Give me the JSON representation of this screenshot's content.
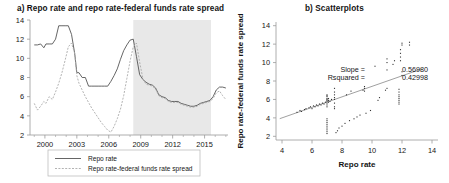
{
  "figure": {
    "panel_a_title": "a) Repo rate and repo rate-federal funds rate spread",
    "panel_b_title": "b) Scatterplots"
  },
  "colors": {
    "series_repo": "#555555",
    "series_spread": "#aaaaaa",
    "shaded_band": "#e8e8e8",
    "axis": "#9a9a9a",
    "point": "#333333",
    "fit_line": "#888888",
    "text": "#161616"
  },
  "panel_a": {
    "legend": [
      {
        "label": "Repo rate",
        "style": "solid"
      },
      {
        "label": "Repo rate-federal funds rate spread",
        "style": "dashed"
      }
    ],
    "yaxis": {
      "ticks": [
        2,
        4,
        6,
        8,
        10,
        12,
        14
      ],
      "tick_labels": [
        "2",
        "4",
        "6",
        "8",
        "10",
        "12",
        "14"
      ],
      "ylim": [
        2,
        14
      ]
    },
    "xaxis": {
      "ticks": [
        2000,
        2003,
        2006,
        2009,
        2012,
        2015
      ],
      "tick_labels": [
        "2000",
        "2003",
        "2006",
        "2009",
        "2012",
        "2015"
      ],
      "xlim": [
        1998.6,
        2017.2
      ]
    },
    "shaded_region": {
      "start": 2008.3,
      "end": 2015.6
    }
  },
  "panel_b": {
    "xlabel": "Repo rate",
    "ylabel": "Repo rate-federal funds rate spread",
    "xaxis": {
      "ticks": [
        4,
        6,
        8,
        10,
        12,
        14
      ],
      "tick_labels": [
        "4",
        "6",
        "8",
        "10",
        "12",
        "14"
      ],
      "xlim": [
        3.6,
        14.4
      ]
    },
    "yaxis": {
      "ticks": [
        2,
        4,
        6,
        8,
        10,
        12,
        14
      ],
      "tick_labels": [
        "2",
        "4",
        "6",
        "8",
        "10",
        "12",
        "14"
      ],
      "ylim": [
        1.6,
        14.4
      ]
    },
    "annotations": {
      "slope_label": "Slope =",
      "slope_value": "0.56980",
      "rsquared_label": "Rsquared =",
      "rsquared_value": "0.42998"
    }
  },
  "chart_data": [
    {
      "type": "line",
      "title": "a) Repo rate and repo rate-federal funds rate spread",
      "xlabel": "",
      "ylabel": "",
      "xlim": [
        1998.6,
        2017.2
      ],
      "ylim": [
        2,
        14
      ],
      "grid": false,
      "legend_position": "below",
      "xticks": [
        2000,
        2003,
        2006,
        2009,
        2012,
        2015
      ],
      "yticks": [
        2,
        4,
        6,
        8,
        10,
        12,
        14
      ],
      "shaded_region": {
        "start": 2008.3,
        "end": 2015.6,
        "color": "#e8e8e8"
      },
      "x": [
        1999.0,
        1999.3,
        1999.6,
        1999.9,
        2000.1,
        2000.4,
        2000.7,
        2001.0,
        2001.3,
        2001.6,
        2001.9,
        2002.2,
        2002.5,
        2002.8,
        2003.0,
        2003.2,
        2003.5,
        2003.8,
        2004.1,
        2004.4,
        2004.7,
        2005.0,
        2005.3,
        2005.6,
        2005.9,
        2006.2,
        2006.5,
        2006.8,
        2007.1,
        2007.4,
        2007.7,
        2008.0,
        2008.3,
        2008.6,
        2008.9,
        2009.2,
        2009.5,
        2009.8,
        2010.1,
        2010.4,
        2010.7,
        2011.0,
        2011.3,
        2011.6,
        2011.9,
        2012.2,
        2012.5,
        2012.8,
        2013.1,
        2013.4,
        2013.7,
        2014.0,
        2014.3,
        2014.6,
        2014.9,
        2015.2,
        2015.5,
        2015.8,
        2016.1,
        2016.4,
        2016.7,
        2017.0
      ],
      "series": [
        {
          "name": "Repo rate",
          "style": "solid",
          "color": "#555555",
          "values": [
            11.4,
            11.4,
            11.5,
            11.1,
            11.5,
            11.5,
            11.5,
            12.0,
            13.4,
            13.4,
            13.4,
            13.4,
            12.5,
            10.5,
            8.5,
            8.5,
            8.0,
            8.0,
            7.1,
            7.1,
            7.1,
            7.1,
            7.1,
            7.1,
            7.1,
            7.6,
            8.2,
            8.9,
            9.9,
            10.8,
            11.4,
            11.9,
            12.0,
            10.2,
            8.3,
            7.8,
            7.5,
            7.3,
            7.2,
            6.9,
            6.2,
            6.0,
            5.9,
            5.6,
            5.5,
            5.5,
            5.5,
            5.3,
            5.2,
            5.1,
            5.0,
            5.0,
            5.1,
            5.3,
            5.4,
            5.5,
            5.6,
            6.0,
            6.7,
            7.0,
            7.0,
            6.9
          ]
        },
        {
          "name": "Repo rate-federal funds rate spread",
          "style": "dashed",
          "color": "#aaaaaa",
          "values": [
            5.3,
            4.6,
            5.0,
            5.5,
            5.3,
            6.0,
            5.7,
            6.5,
            7.4,
            8.5,
            9.8,
            11.2,
            11.6,
            10.5,
            8.2,
            7.4,
            6.7,
            6.0,
            5.4,
            4.8,
            4.3,
            3.8,
            3.3,
            2.9,
            2.5,
            2.3,
            2.9,
            3.7,
            4.7,
            6.1,
            7.9,
            9.7,
            11.2,
            11.6,
            9.6,
            7.9,
            7.3,
            7.2,
            7.1,
            6.8,
            6.1,
            5.9,
            5.8,
            5.5,
            5.4,
            5.4,
            5.4,
            5.2,
            5.1,
            5.0,
            4.9,
            4.9,
            5.0,
            5.2,
            5.3,
            5.4,
            5.5,
            5.8,
            6.4,
            6.6,
            6.1,
            5.7
          ]
        }
      ]
    },
    {
      "type": "scatter",
      "title": "b) Scatterplots",
      "xlabel": "Repo rate",
      "ylabel": "Repo rate-federal funds rate spread",
      "xlim": [
        3.6,
        14.4
      ],
      "ylim": [
        1.6,
        14.4
      ],
      "grid": false,
      "xticks": [
        4,
        6,
        8,
        10,
        12,
        14
      ],
      "yticks": [
        2,
        4,
        6,
        8,
        10,
        12,
        14
      ],
      "fit_line": {
        "slope": 0.5698,
        "intercept": 1.72,
        "rsquared": 0.42998
      },
      "annotations": [
        "Slope = 0.56980",
        "Rsquared = 0.42998"
      ],
      "points": [
        [
          5.0,
          4.6
        ],
        [
          5.2,
          4.8
        ],
        [
          5.3,
          4.7
        ],
        [
          5.5,
          4.9
        ],
        [
          5.6,
          5.0
        ],
        [
          5.8,
          5.1
        ],
        [
          5.9,
          5.2
        ],
        [
          6.0,
          5.0
        ],
        [
          6.1,
          5.3
        ],
        [
          6.2,
          5.2
        ],
        [
          6.3,
          5.4
        ],
        [
          6.4,
          5.3
        ],
        [
          6.5,
          5.5
        ],
        [
          6.6,
          5.4
        ],
        [
          6.7,
          5.6
        ],
        [
          6.8,
          5.5
        ],
        [
          6.9,
          5.7
        ],
        [
          7.0,
          5.6
        ],
        [
          7.0,
          5.9
        ],
        [
          7.0,
          6.1
        ],
        [
          7.0,
          6.3
        ],
        [
          7.0,
          6.4
        ],
        [
          7.0,
          6.5
        ],
        [
          7.0,
          6.0
        ],
        [
          7.0,
          5.8
        ],
        [
          7.0,
          5.4
        ],
        [
          7.0,
          5.2
        ],
        [
          7.0,
          3.9
        ],
        [
          7.0,
          3.7
        ],
        [
          7.0,
          3.5
        ],
        [
          7.0,
          3.3
        ],
        [
          7.0,
          3.1
        ],
        [
          7.0,
          2.9
        ],
        [
          7.0,
          2.7
        ],
        [
          7.0,
          2.5
        ],
        [
          7.0,
          2.3
        ],
        [
          7.1,
          5.7
        ],
        [
          7.1,
          5.9
        ],
        [
          7.1,
          6.1
        ],
        [
          7.2,
          5.8
        ],
        [
          7.3,
          6.0
        ],
        [
          7.5,
          6.0
        ],
        [
          7.5,
          6.2
        ],
        [
          7.5,
          6.5
        ],
        [
          7.5,
          6.8
        ],
        [
          7.5,
          7.2
        ],
        [
          7.5,
          5.6
        ],
        [
          7.5,
          5.2
        ],
        [
          7.5,
          5.0
        ],
        [
          7.6,
          2.4
        ],
        [
          7.7,
          2.6
        ],
        [
          7.8,
          2.9
        ],
        [
          8.0,
          3.1
        ],
        [
          8.2,
          3.4
        ],
        [
          8.3,
          6.5
        ],
        [
          8.5,
          3.7
        ],
        [
          8.6,
          6.9
        ],
        [
          8.8,
          3.9
        ],
        [
          9.0,
          4.1
        ],
        [
          9.2,
          4.3
        ],
        [
          9.4,
          7.0
        ],
        [
          9.5,
          7.2
        ],
        [
          9.5,
          7.4
        ],
        [
          9.5,
          6.9
        ],
        [
          9.6,
          4.5
        ],
        [
          9.9,
          4.8
        ],
        [
          10.2,
          9.6
        ],
        [
          10.4,
          5.9
        ],
        [
          10.5,
          6.2
        ],
        [
          10.9,
          7.0
        ],
        [
          11.0,
          7.2
        ],
        [
          11.0,
          9.2
        ],
        [
          11.0,
          10.0
        ],
        [
          11.0,
          10.4
        ],
        [
          11.4,
          9.8
        ],
        [
          11.5,
          10.2
        ],
        [
          11.8,
          5.5
        ],
        [
          11.8,
          5.7
        ],
        [
          11.8,
          5.9
        ],
        [
          11.8,
          6.1
        ],
        [
          11.8,
          6.3
        ],
        [
          11.8,
          6.5
        ],
        [
          11.8,
          6.8
        ],
        [
          11.8,
          7.1
        ],
        [
          11.9,
          10.2
        ],
        [
          11.9,
          10.6
        ],
        [
          11.9,
          11.0
        ],
        [
          11.9,
          11.4
        ],
        [
          12.0,
          11.9
        ],
        [
          12.0,
          12.1
        ],
        [
          12.5,
          11.9
        ],
        [
          12.5,
          12.2
        ],
        [
          12.0,
          9.0
        ],
        [
          12.0,
          8.6
        ]
      ]
    }
  ]
}
